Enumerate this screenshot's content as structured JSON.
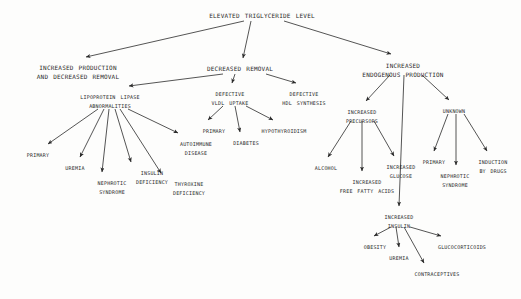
{
  "diagram": {
    "title": "Elevated triglyceride level",
    "type": "flowchart-tree",
    "ink_color": "#2a2a2a",
    "background_color": "#fdfdfc",
    "nodes": [
      {
        "id": "root",
        "lines": [
          "Elevated triglyceride level"
        ],
        "x": 262,
        "y": 11,
        "size": "s-root"
      },
      {
        "id": "incr_prod",
        "lines": [
          "Increased production",
          "and decreased removal"
        ],
        "x": 78,
        "y": 64,
        "size": "s-major"
      },
      {
        "id": "decr_removal",
        "lines": [
          "Decreased removal"
        ],
        "x": 240,
        "y": 65,
        "size": "s-major"
      },
      {
        "id": "incr_endog",
        "lines": [
          "Increased",
          "endogenous production"
        ],
        "x": 403,
        "y": 62,
        "size": "s-major"
      },
      {
        "id": "lpl_abn",
        "lines": [
          "Lipoprotein lipase",
          "abnormalities"
        ],
        "x": 110,
        "y": 93,
        "size": "s-mid"
      },
      {
        "id": "def_vldl",
        "lines": [
          "Defective",
          "VLDL uptake"
        ],
        "x": 230,
        "y": 90,
        "size": "s-mid"
      },
      {
        "id": "def_hdl",
        "lines": [
          "Defective",
          "HDL synthesis"
        ],
        "x": 304,
        "y": 90,
        "size": "s-mid"
      },
      {
        "id": "incr_prec",
        "lines": [
          "Increased",
          "precursors"
        ],
        "x": 362,
        "y": 108,
        "size": "s-mid"
      },
      {
        "id": "unknown",
        "lines": [
          "Unknown"
        ],
        "x": 454,
        "y": 107,
        "size": "s-mid"
      },
      {
        "id": "primary_l",
        "lines": [
          "Primary"
        ],
        "x": 38,
        "y": 151,
        "size": "s-leaf"
      },
      {
        "id": "uremia_l",
        "lines": [
          "Uremia"
        ],
        "x": 75,
        "y": 164,
        "size": "s-leaf"
      },
      {
        "id": "nephrotic_l",
        "lines": [
          "Nephrotic",
          "syndrome"
        ],
        "x": 112,
        "y": 179,
        "size": "s-leaf"
      },
      {
        "id": "insulin_def",
        "lines": [
          "Insulin",
          "deficiency"
        ],
        "x": 152,
        "y": 169,
        "size": "s-leaf"
      },
      {
        "id": "thyroxine_def",
        "lines": [
          "Thyroxine",
          "deficiency"
        ],
        "x": 189,
        "y": 180,
        "size": "s-leaf"
      },
      {
        "id": "autoimmune",
        "lines": [
          "Autoimmune",
          "disease"
        ],
        "x": 196,
        "y": 140,
        "size": "s-leaf"
      },
      {
        "id": "primary_m",
        "lines": [
          "Primary"
        ],
        "x": 214,
        "y": 127,
        "size": "s-leaf"
      },
      {
        "id": "diabetes",
        "lines": [
          "Diabetes"
        ],
        "x": 246,
        "y": 139,
        "size": "s-leaf"
      },
      {
        "id": "hypothyroid",
        "lines": [
          "Hypothyroidism"
        ],
        "x": 284,
        "y": 127,
        "size": "s-leaf"
      },
      {
        "id": "alcohol",
        "lines": [
          "Alcohol"
        ],
        "x": 326,
        "y": 164,
        "size": "s-leaf"
      },
      {
        "id": "free_fatty",
        "lines": [
          "Increased",
          "free fatty acids"
        ],
        "x": 367,
        "y": 178,
        "size": "s-leaf"
      },
      {
        "id": "incr_glucose",
        "lines": [
          "Increased",
          "glucose"
        ],
        "x": 401,
        "y": 163,
        "size": "s-leaf"
      },
      {
        "id": "primary_r",
        "lines": [
          "Primary"
        ],
        "x": 434,
        "y": 158,
        "size": "s-leaf"
      },
      {
        "id": "nephrotic_r",
        "lines": [
          "Nephrotic",
          "syndrome"
        ],
        "x": 455,
        "y": 172,
        "size": "s-leaf"
      },
      {
        "id": "induct_drugs",
        "lines": [
          "Induction",
          "by drugs"
        ],
        "x": 493,
        "y": 158,
        "size": "s-leaf"
      },
      {
        "id": "incr_insulin",
        "lines": [
          "Increased",
          "insulin"
        ],
        "x": 399,
        "y": 213,
        "size": "s-leaf"
      },
      {
        "id": "obesity",
        "lines": [
          "Obesity"
        ],
        "x": 375,
        "y": 243,
        "size": "s-leaf"
      },
      {
        "id": "uremia_r",
        "lines": [
          "Uremia"
        ],
        "x": 399,
        "y": 254,
        "size": "s-leaf"
      },
      {
        "id": "contracept",
        "lines": [
          "Contraceptives"
        ],
        "x": 437,
        "y": 270,
        "size": "s-leaf"
      },
      {
        "id": "glucocort",
        "lines": [
          "Glucocorticoids"
        ],
        "x": 462,
        "y": 243,
        "size": "s-leaf"
      }
    ],
    "edges": [
      {
        "from": "root",
        "to": "incr_prod",
        "x1": 244,
        "y1": 21,
        "x2": 86,
        "y2": 57
      },
      {
        "from": "root",
        "to": "decr_removal",
        "x1": 251,
        "y1": 21,
        "x2": 243,
        "y2": 58
      },
      {
        "from": "root",
        "to": "incr_endog",
        "x1": 284,
        "y1": 21,
        "x2": 391,
        "y2": 54
      },
      {
        "from": "decr_removal",
        "to": "lpl_abn",
        "x1": 223,
        "y1": 74,
        "x2": 129,
        "y2": 86
      },
      {
        "from": "decr_removal",
        "to": "def_vldl",
        "x1": 235,
        "y1": 74,
        "x2": 232,
        "y2": 83
      },
      {
        "from": "decr_removal",
        "to": "def_hdl",
        "x1": 266,
        "y1": 74,
        "x2": 296,
        "y2": 83
      },
      {
        "from": "lpl_abn",
        "to": "primary_l",
        "x1": 98,
        "y1": 109,
        "x2": 48,
        "y2": 144
      },
      {
        "from": "lpl_abn",
        "to": "uremia_l",
        "x1": 104,
        "y1": 109,
        "x2": 80,
        "y2": 157
      },
      {
        "from": "lpl_abn",
        "to": "nephrotic_l",
        "x1": 109,
        "y1": 109,
        "x2": 102,
        "y2": 172
      },
      {
        "from": "lpl_abn",
        "to": "insulin_def",
        "x1": 115,
        "y1": 109,
        "x2": 131,
        "y2": 162
      },
      {
        "from": "lpl_abn",
        "to": "thyroxine_def",
        "x1": 120,
        "y1": 109,
        "x2": 161,
        "y2": 173
      },
      {
        "from": "lpl_abn",
        "to": "autoimmune",
        "x1": 128,
        "y1": 109,
        "x2": 178,
        "y2": 133
      },
      {
        "from": "def_vldl",
        "to": "primary_m",
        "x1": 223,
        "y1": 106,
        "x2": 208,
        "y2": 120
      },
      {
        "from": "def_vldl",
        "to": "diabetes",
        "x1": 235,
        "y1": 106,
        "x2": 240,
        "y2": 132
      },
      {
        "from": "def_vldl",
        "to": "hypothyroid",
        "x1": 246,
        "y1": 106,
        "x2": 273,
        "y2": 120
      },
      {
        "from": "incr_endog",
        "to": "incr_prec",
        "x1": 390,
        "y1": 75,
        "x2": 366,
        "y2": 101
      },
      {
        "from": "incr_endog",
        "to": "incr_insulin",
        "x1": 404,
        "y1": 75,
        "x2": 399,
        "y2": 206
      },
      {
        "from": "incr_endog",
        "to": "unknown",
        "x1": 422,
        "y1": 75,
        "x2": 449,
        "y2": 100
      },
      {
        "from": "incr_prec",
        "to": "alcohol",
        "x1": 351,
        "y1": 121,
        "x2": 328,
        "y2": 157
      },
      {
        "from": "incr_prec",
        "to": "free_fatty",
        "x1": 362,
        "y1": 121,
        "x2": 362,
        "y2": 171
      },
      {
        "from": "incr_prec",
        "to": "incr_glucose",
        "x1": 374,
        "y1": 121,
        "x2": 394,
        "y2": 156
      },
      {
        "from": "unknown",
        "to": "primary_r",
        "x1": 448,
        "y1": 114,
        "x2": 434,
        "y2": 151
      },
      {
        "from": "unknown",
        "to": "nephrotic_r",
        "x1": 456,
        "y1": 114,
        "x2": 456,
        "y2": 165
      },
      {
        "from": "unknown",
        "to": "induct_drugs",
        "x1": 464,
        "y1": 114,
        "x2": 487,
        "y2": 151
      },
      {
        "from": "incr_insulin",
        "to": "obesity",
        "x1": 391,
        "y1": 227,
        "x2": 374,
        "y2": 236
      },
      {
        "from": "incr_insulin",
        "to": "uremia_r",
        "x1": 396,
        "y1": 227,
        "x2": 399,
        "y2": 247
      },
      {
        "from": "incr_insulin",
        "to": "contracept",
        "x1": 404,
        "y1": 227,
        "x2": 424,
        "y2": 263
      },
      {
        "from": "incr_insulin",
        "to": "glucocort",
        "x1": 410,
        "y1": 227,
        "x2": 441,
        "y2": 236
      }
    ]
  }
}
